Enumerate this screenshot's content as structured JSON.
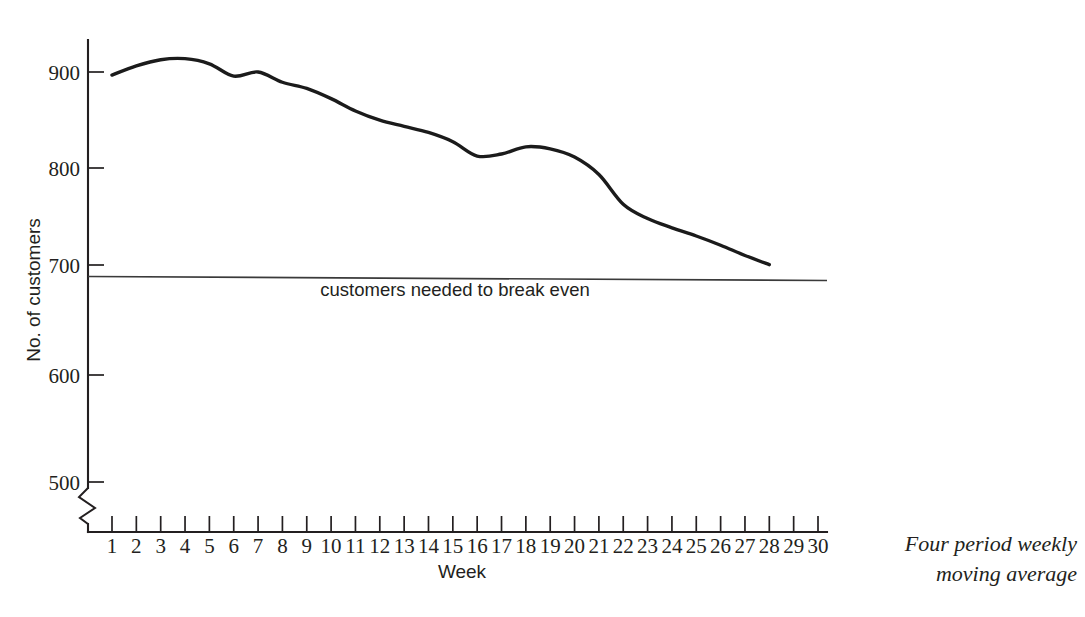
{
  "chart_data": {
    "type": "line",
    "title": "",
    "subtitle": "",
    "xlabel": "Week",
    "ylabel": "No. of customers",
    "xlim": [
      0,
      30
    ],
    "ylim": [
      480,
      935
    ],
    "grid": false,
    "legend_position": "none",
    "y_axis_break": true,
    "y_axis_break_below": 500,
    "x_tick_labels": [
      "1",
      "2",
      "3",
      "4",
      "5",
      "6",
      "7",
      "8",
      "9",
      "10",
      "11",
      "12",
      "13",
      "14",
      "15",
      "16",
      "17",
      "18",
      "19",
      "20",
      "21",
      "22",
      "23",
      "24",
      "25",
      "26",
      "27",
      "28",
      "29",
      "30"
    ],
    "y_tick_labels": [
      "500",
      "600",
      "700",
      "800",
      "900"
    ],
    "y_ticks": [
      500,
      600,
      700,
      800,
      900
    ],
    "series": [
      {
        "name": "Four period weekly moving average",
        "x": [
          1,
          2,
          3,
          4,
          5,
          6,
          7,
          8,
          9,
          10,
          11,
          12,
          13,
          14,
          15,
          16,
          17,
          18,
          19,
          20,
          21,
          22,
          23,
          24,
          25,
          26,
          27,
          28
        ],
        "values": [
          897,
          906,
          912,
          913,
          908,
          896,
          900,
          890,
          884,
          874,
          862,
          853,
          847,
          841,
          832,
          818,
          820,
          827,
          825,
          817,
          800,
          771,
          757,
          748,
          740,
          731,
          721,
          712
        ]
      }
    ],
    "reference_lines": [
      {
        "name": "break-even",
        "value": 700,
        "label": "customers needed to break even",
        "orientation": "horizontal"
      }
    ],
    "annotations": [
      {
        "name": "series-note",
        "line1": "Four period weekly",
        "line2": "moving average"
      }
    ]
  },
  "axis": {
    "y_title": "No. of customers",
    "x_title": "Week"
  },
  "colors": {
    "series": "#1b1b1b",
    "axis": "#231f20",
    "threshold": "#3a3a3a",
    "background": "#ffffff"
  }
}
